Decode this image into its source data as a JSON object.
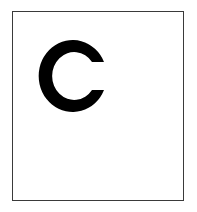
{
  "card": {
    "letter": "C",
    "colors": {
      "letter": "#000000",
      "border": "#3a3a3a",
      "background": "#ffffff"
    }
  }
}
